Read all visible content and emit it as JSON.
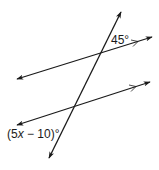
{
  "diagram": {
    "type": "parallel-lines-cut-by-transversal",
    "stroke_color": "#1a1a1a",
    "angle_top": {
      "label": "45°",
      "value_deg": 45
    },
    "angle_bottom": {
      "prefix": "(5",
      "variable": "x",
      "suffix": " − 10)°",
      "expression": "(5x − 10)°"
    },
    "lines": [
      {
        "name": "parallel-line-top",
        "from": [
          17,
          79
        ],
        "to": [
          152,
          37
        ],
        "parallel_mark": "single-chevron"
      },
      {
        "name": "parallel-line-bottom",
        "from": [
          17,
          125
        ],
        "to": [
          150,
          82
        ],
        "parallel_mark": "single-chevron"
      },
      {
        "name": "transversal",
        "from": [
          121,
          12
        ],
        "to": [
          49,
          158
        ]
      }
    ]
  }
}
